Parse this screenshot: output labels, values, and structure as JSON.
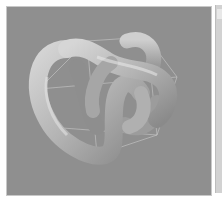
{
  "viewport": {
    "object": "torus-knot",
    "background_color": "#8f8f8f",
    "object_color": "#b8b8b8",
    "bounding_box_color": "#d8d8d8"
  },
  "side_panel": {
    "background_color": "#d2d2d2"
  }
}
